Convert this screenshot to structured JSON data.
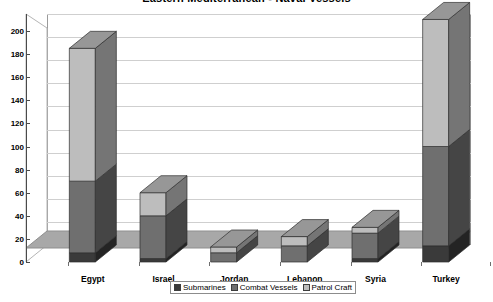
{
  "chart_data": {
    "type": "bar",
    "subtype": "stacked-3d-column",
    "title": "Eastern Mediterranean - Naval Vessels",
    "xlabel": "",
    "ylabel": "",
    "ylim": [
      0,
      200
    ],
    "ytick_step": 20,
    "yticks": [
      0,
      20,
      40,
      60,
      80,
      100,
      120,
      140,
      160,
      180,
      200
    ],
    "ytick_labels": [
      "0",
      "20",
      "40",
      "60",
      "80",
      "100",
      "120",
      "140",
      "160",
      "180",
      "200"
    ],
    "grid": true,
    "grid_axis": "y",
    "legend_position": "bottom",
    "categories": [
      "Egypt",
      "Israel",
      "Jordan",
      "Lebanon",
      "Syria",
      "Turkey"
    ],
    "series": [
      {
        "name": "Submarines",
        "color": "#3a3a3a",
        "values": [
          8,
          3,
          0,
          0,
          3,
          14
        ]
      },
      {
        "name": "Combat Vessels",
        "color": "#6f6f6f",
        "values": [
          62,
          37,
          8,
          14,
          22,
          86
        ]
      },
      {
        "name": "Patrol Craft",
        "color": "#bdbdbd",
        "values": [
          115,
          20,
          5,
          8,
          5,
          110
        ]
      }
    ],
    "totals": [
      185,
      60,
      13,
      22,
      30,
      210
    ]
  },
  "legend": {
    "items": [
      {
        "label": "Submarines"
      },
      {
        "label": "Combat Vessels"
      },
      {
        "label": "Patrol Craft"
      }
    ]
  },
  "colors": {
    "submarines": "#3a3a3a",
    "combat_vessels": "#6f6f6f",
    "patrol_craft": "#bdbdbd",
    "floor": "#a8a8a8",
    "wall": "#ffffff",
    "grid": "#cfcfcf",
    "axis": "#4a4a4a"
  }
}
